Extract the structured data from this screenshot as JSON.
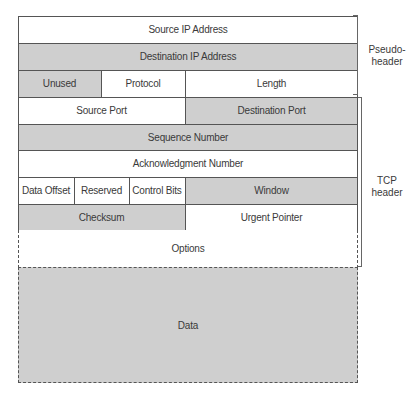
{
  "diagram": {
    "rows": [
      {
        "fields": [
          {
            "label": "Source IP Address",
            "shade": "white"
          }
        ]
      },
      {
        "fields": [
          {
            "label": "Destination IP Address",
            "shade": "gray"
          }
        ]
      },
      {
        "fields": [
          {
            "label": "Unused",
            "shade": "gray"
          },
          {
            "label": "Protocol",
            "shade": "white"
          },
          {
            "label": "Length",
            "shade": "white"
          }
        ]
      },
      {
        "fields": [
          {
            "label": "Source Port",
            "shade": "white"
          },
          {
            "label": "Destination Port",
            "shade": "gray"
          }
        ]
      },
      {
        "fields": [
          {
            "label": "Sequence Number",
            "shade": "gray"
          }
        ]
      },
      {
        "fields": [
          {
            "label": "Acknowledgment Number",
            "shade": "white"
          }
        ]
      },
      {
        "fields": [
          {
            "label": "Data Offset",
            "shade": "white"
          },
          {
            "label": "Reserved",
            "shade": "white"
          },
          {
            "label": "Control Bits",
            "shade": "white"
          },
          {
            "label": "Window",
            "shade": "gray"
          }
        ]
      },
      {
        "fields": [
          {
            "label": "Checksum",
            "shade": "gray"
          },
          {
            "label": "Urgent Pointer",
            "shade": "white"
          }
        ]
      },
      {
        "fields": [
          {
            "label": "Options",
            "shade": "white",
            "border": "dashed"
          }
        ]
      },
      {
        "fields": [
          {
            "label": "Data",
            "shade": "gray",
            "border": "dashed"
          }
        ]
      }
    ],
    "brackets": [
      {
        "label_line1": "Pseudo-",
        "label_line2": "header",
        "spans_rows": "1-3"
      },
      {
        "label_line1": "TCP",
        "label_line2": "header",
        "spans_rows": "4-9"
      }
    ],
    "colors": {
      "gray_fill": "#cfcfcf",
      "white_fill": "#ffffff",
      "line": "#555555"
    }
  }
}
